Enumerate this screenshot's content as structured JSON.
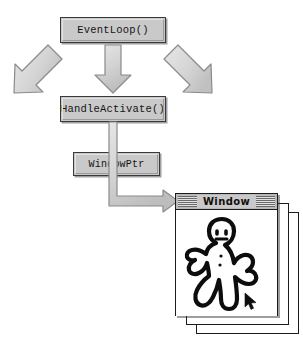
{
  "diagram": {
    "colors": {
      "box_fill": "#c9c9c9",
      "box_border": "#3a3a3a",
      "arrow_fill": "#d2d2d2",
      "arrow_border": "#8a8a8a",
      "window_border": "#1b1b1b",
      "titlebar_fill": "#b9b9b9",
      "page_background": "#ffffff",
      "ink": "#101010"
    },
    "nodes": [
      {
        "id": "eventloop",
        "label": "EventLoop()"
      },
      {
        "id": "handleactivate",
        "label": "HandleActivate()"
      },
      {
        "id": "windowptr",
        "label": "WindowPtr"
      }
    ],
    "arrows": [
      {
        "id": "branch-left",
        "from": "eventloop",
        "to": "",
        "direction": "down-left",
        "style": "outlined-block"
      },
      {
        "id": "branch-down",
        "from": "eventloop",
        "to": "handleactivate",
        "direction": "down",
        "style": "outlined-block"
      },
      {
        "id": "branch-right",
        "from": "eventloop",
        "to": "",
        "direction": "down-right",
        "style": "outlined-block"
      },
      {
        "id": "elbow-to-window",
        "from": "handleactivate",
        "to": "window-front",
        "direction": "down-then-right",
        "style": "outlined-elbow"
      }
    ],
    "window_stack": {
      "front": {
        "title": "Window",
        "titlebar_style": "striped-active",
        "content": "hand-drawn gingerbread figure doodle",
        "cursor": "arrow-pointer"
      },
      "background_count": 2
    }
  }
}
